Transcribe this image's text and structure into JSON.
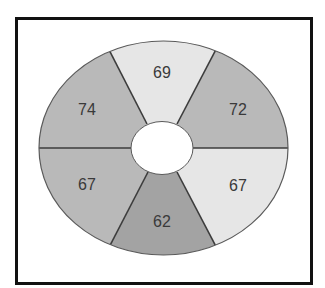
{
  "diagram": {
    "type": "segmented-ring",
    "segment_count": 6,
    "colors": {
      "light": "#e6e6e6",
      "medium": "#b9b9b9",
      "dark": "#a3a3a3",
      "divider": "#3c3c3c",
      "frame": "#111111",
      "hole": "#ffffff",
      "label": "#3a3a3a"
    },
    "segments": [
      {
        "position": "top",
        "label": "69",
        "shade": "light"
      },
      {
        "position": "upper-right",
        "label": "72",
        "shade": "medium"
      },
      {
        "position": "lower-right",
        "label": "67",
        "shade": "light"
      },
      {
        "position": "bottom",
        "label": "62",
        "shade": "dark"
      },
      {
        "position": "lower-left",
        "label": "67",
        "shade": "medium"
      },
      {
        "position": "upper-left",
        "label": "74",
        "shade": "medium"
      }
    ]
  }
}
